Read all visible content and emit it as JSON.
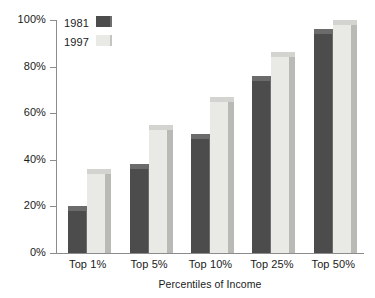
{
  "chart_data": {
    "type": "bar",
    "title": "",
    "subtitle": "",
    "xlabel": "Percentiles of Income",
    "ylabel": "",
    "categories": [
      "Top 1%",
      "Top 5%",
      "Top 10%",
      "Top 25%",
      "Top 50%"
    ],
    "series": [
      {
        "name": "1981",
        "color": "#4c4c4c",
        "values": [
          18,
          36,
          49,
          74,
          94
        ]
      },
      {
        "name": "1997",
        "color": "#e9e9e5",
        "values": [
          34,
          53,
          65,
          84,
          98
        ]
      }
    ],
    "ylim": [
      0,
      100
    ],
    "y_ticks": [
      0,
      20,
      40,
      60,
      80,
      100
    ],
    "y_tick_labels": [
      "0%",
      "20%",
      "40%",
      "60%",
      "80%",
      "100%"
    ],
    "grid": false,
    "legend_position": "top-left",
    "style": "3d-bars"
  },
  "legend": {
    "items": [
      {
        "label": "1981",
        "swatch": "dark"
      },
      {
        "label": "1997",
        "swatch": "light"
      }
    ]
  },
  "axis": {
    "x_title": "Percentiles of Income",
    "y_tick_labels": [
      "100%",
      "80%",
      "60%",
      "40%",
      "20%",
      "0%"
    ],
    "x_tick_labels": [
      "Top 1%",
      "Top 5%",
      "Top 10%",
      "Top 25%",
      "Top 50%"
    ]
  }
}
